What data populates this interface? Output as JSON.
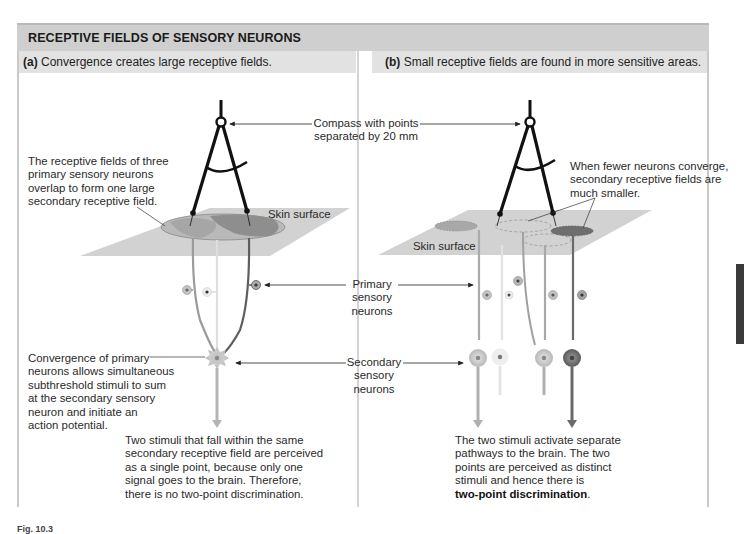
{
  "header": {
    "title": "RECEPTIVE FIELDS OF SENSORY NEURONS"
  },
  "panels": {
    "a": {
      "letter": "(a)",
      "subtitle": "Convergence creates large receptive fields.",
      "annotation_fields": [
        "The receptive fields of three",
        "primary sensory neurons",
        "overlap to form one large",
        "secondary receptive field."
      ],
      "skin_label": "Skin surface",
      "convergence_note": [
        "Convergence of primary",
        "neurons allows simultaneous",
        "subthreshold stimuli to sum",
        "at the secondary sensory",
        "neuron and initiate an",
        "action potential."
      ],
      "conclusion": [
        "Two stimuli that fall within the same",
        "secondary receptive field are perceived",
        "as a single point, because only one",
        "signal goes to the brain. Therefore,",
        "there is no two-point discrimination."
      ]
    },
    "b": {
      "letter": "(b)",
      "subtitle": "Small receptive fields are found in more sensitive areas.",
      "annotation_fields": [
        "When fewer neurons converge,",
        "secondary receptive fields are",
        "much smaller."
      ],
      "skin_label": "Skin surface",
      "conclusion": [
        "The two stimuli activate separate",
        "pathways to the brain. The two",
        "points are perceived as distinct",
        "stimuli and hence there is"
      ],
      "conclusion_bold": "two-point discrimination",
      "conclusion_end": "."
    }
  },
  "center_labels": {
    "compass": [
      "Compass with points",
      "separated by 20 mm"
    ],
    "primary": [
      "Primary",
      "sensory",
      "neurons"
    ],
    "secondary": [
      "Secondary",
      "sensory",
      "neurons"
    ]
  },
  "figure_label": "Fig. 10.3",
  "colors": {
    "title_bar": "#cfcfcf",
    "subtitle_bar": "#e2e2e2",
    "skin": "#cdcdcd",
    "field_light": "#bdbdbd",
    "field_mid": "#9a9a9a",
    "field_dark": "#6e6e6e",
    "compass": "#111111"
  }
}
